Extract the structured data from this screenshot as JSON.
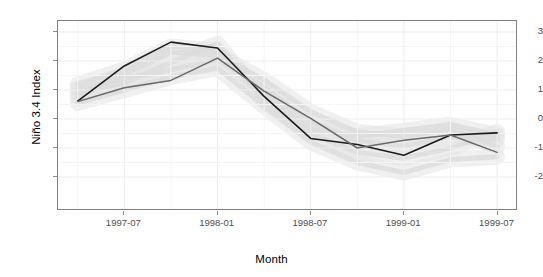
{
  "chart_data": {
    "type": "line",
    "title": "",
    "xlabel": "Month",
    "ylabel": "Niño 3.4 Index",
    "xlim": [
      "1997-04",
      "1999-07"
    ],
    "ylim": [
      -2.6,
      3.4
    ],
    "grid": true,
    "legend": "none",
    "y_ticks": [
      3,
      2,
      1,
      0,
      -1,
      -2
    ],
    "y_tick_labels": [
      "3",
      "2",
      "1",
      "0",
      "-1",
      "-2"
    ],
    "x_ticks": [
      "1997-07",
      "1998-01",
      "1998-07",
      "1999-01",
      "1999-07"
    ],
    "x_tick_labels": [
      "1997-07",
      "1998-01",
      "1998-07",
      "1999-01",
      "1999-07"
    ],
    "x": [
      "1997-04",
      "1997-07",
      "1997-10",
      "1998-01",
      "1998-04",
      "1998-07",
      "1998-10",
      "1999-01",
      "1999-04",
      "1999-07"
    ],
    "series": [
      {
        "name": "observed",
        "color": "#1a1a1a",
        "width": 1.6,
        "values": [
          0.62,
          1.83,
          2.65,
          2.45,
          0.78,
          -0.67,
          -0.88,
          -1.25,
          -0.55,
          -0.48
        ]
      },
      {
        "name": "forecast",
        "color": "#696969",
        "width": 1.5,
        "values": [
          0.6,
          1.08,
          1.33,
          2.1,
          0.96,
          0.02,
          -1.0,
          -0.73,
          -0.55,
          -1.15
        ]
      }
    ],
    "background_traces": {
      "name": "ensemble-spaghetti",
      "color": "#e3e3e3",
      "opacity": 0.55,
      "note": "faint light-grey background ensemble lines",
      "members": [
        [
          1.05,
          1.4,
          1.7,
          2.05,
          1.1,
          -0.1,
          -0.75,
          -0.95,
          -0.6,
          -0.7
        ],
        [
          0.9,
          1.25,
          1.95,
          2.6,
          0.6,
          -0.5,
          -1.15,
          -1.35,
          -1.0,
          -0.45
        ],
        [
          0.75,
          1.55,
          2.3,
          2.2,
          1.35,
          0.25,
          -0.45,
          -0.6,
          -0.35,
          -0.95
        ],
        [
          0.55,
          1.0,
          1.45,
          1.75,
          0.45,
          -0.8,
          -1.5,
          -1.85,
          -1.4,
          -1.3
        ],
        [
          1.2,
          1.7,
          2.5,
          2.35,
          0.9,
          -0.35,
          -0.6,
          -0.4,
          -0.2,
          -0.55
        ]
      ]
    }
  }
}
